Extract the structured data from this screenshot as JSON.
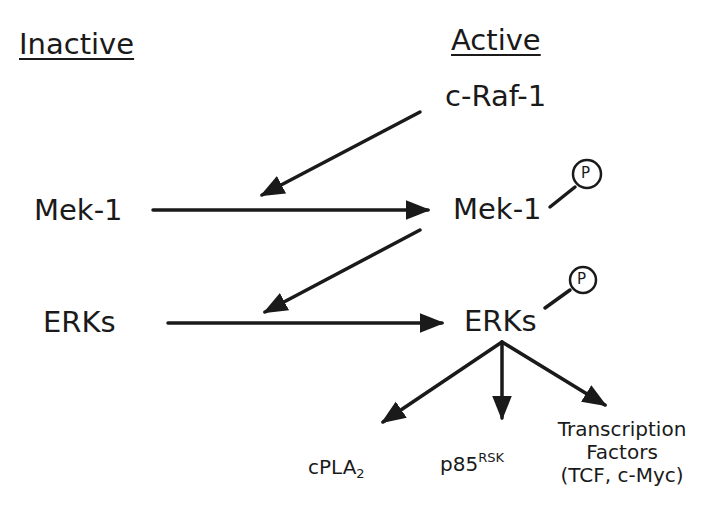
{
  "headers": {
    "inactive": "Inactive",
    "active": "Active"
  },
  "nodes": {
    "raf": "c-Raf-1",
    "mek_inactive": "Mek-1",
    "mek_active": "Mek-1",
    "erk_inactive": "ERKs",
    "erk_active": "ERKs"
  },
  "phospho_label": "P",
  "targets": {
    "cpla2": {
      "base": "cPLA",
      "sub": "2"
    },
    "p85": {
      "base": "p85",
      "sup": "RSK"
    },
    "tf": {
      "line1": "Transcription",
      "line2": "Factors",
      "line3": "(TCF, c-Myc)"
    }
  },
  "colors": {
    "ink": "#1a1a1a",
    "background": "#ffffff"
  }
}
